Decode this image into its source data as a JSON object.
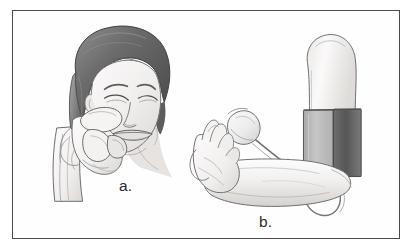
{
  "figure": {
    "frame_color": "#4a4a4a",
    "background_color": "#fefefe",
    "panels": [
      {
        "id": "a",
        "label": "a.",
        "subject": "woman-pinching-cheek-skin",
        "description": "Line drawing of a smiling woman with a dark bobbed haircut and bangs, eyes squinted shut, pinching a fold of skin on her cheek with the thumb and index finger of her raised hand.",
        "elements": [
          "head-with-bob-haircut",
          "bangs",
          "closed-eye-left",
          "closed-eye-right",
          "eyebrows",
          "nose",
          "smiling-mouth",
          "ear",
          "hand",
          "thumb",
          "index-finger",
          "pinched-skin-fold",
          "wrist",
          "forearm"
        ]
      },
      {
        "id": "b",
        "label": "b.",
        "subject": "arm-with-blood-pressure-cuff",
        "description": "Line drawing of a bent arm shown from the side with the hand raised and fingers extended, a blood pressure cuff wrapped around the upper arm, and an inflation bulb connected by rubber tubing looped over the forearm.",
        "elements": [
          "hand",
          "fingers",
          "thumb",
          "wrist",
          "forearm",
          "elbow",
          "upper-arm",
          "blood-pressure-cuff",
          "cuff-light-panel",
          "cuff-dark-panel",
          "inflation-bulb",
          "rubber-tubing",
          "tubing-loop"
        ]
      }
    ],
    "colors": {
      "outline": "#3c3c3c",
      "line_light": "#8c8c8c",
      "skin_light": "#f2f1f0",
      "skin_shade": "#d8d6d4",
      "hair_dark": "#4e4e4e",
      "hair_mid": "#6e6e6e",
      "hair_light": "#9a9a9a",
      "cuff_light": "#b9b9b9",
      "cuff_dark": "#5f5f5f",
      "label_color": "#2b2b2b"
    }
  }
}
